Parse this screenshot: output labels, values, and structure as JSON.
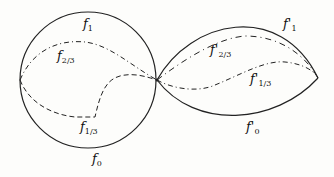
{
  "diagram": {
    "left": {
      "labels": {
        "f1": {
          "base": "f",
          "sub": "1"
        },
        "f23": {
          "base": "f",
          "sub": "2/3"
        },
        "f13": {
          "base": "f",
          "sub": "1/3"
        },
        "f0": {
          "base": "f",
          "sub": "0"
        }
      }
    },
    "right": {
      "labels": {
        "f1": {
          "base": "f'",
          "sub": "1"
        },
        "f23": {
          "base": "f'",
          "sub": "2/3"
        },
        "f13": {
          "base": "f'",
          "sub": "1/3"
        },
        "f0": {
          "base": "f'",
          "sub": "0"
        }
      }
    },
    "colors": {
      "stroke": "#222222",
      "background": "#fdfdfb"
    }
  }
}
